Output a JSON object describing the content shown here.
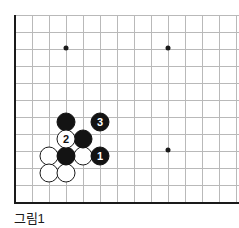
{
  "figure": {
    "caption": "그림1",
    "kind": "go-board-diagram"
  },
  "board": {
    "origin_x": 15,
    "origin_y": 15,
    "cell": 17,
    "cols": 14,
    "rows": 11,
    "edge_color": "#1a1a1a",
    "grid_color": "#b9b9b9",
    "background": "#ffffff"
  },
  "star_points": [
    {
      "name": "star-point-top-left",
      "x": 66,
      "y": 48
    },
    {
      "name": "star-point-top-right",
      "x": 168,
      "y": 48
    },
    {
      "name": "star-point-bottom-right",
      "x": 168,
      "y": 150
    }
  ],
  "stones": [
    {
      "id": "white-a",
      "color": "white",
      "x": 49,
      "y": 156,
      "label": ""
    },
    {
      "id": "white-b",
      "color": "white",
      "x": 83,
      "y": 156,
      "label": ""
    },
    {
      "id": "white-c",
      "color": "white",
      "x": 49,
      "y": 173,
      "label": ""
    },
    {
      "id": "white-d",
      "color": "white",
      "x": 66,
      "y": 173,
      "label": ""
    },
    {
      "id": "black-a",
      "color": "black",
      "x": 66,
      "y": 122,
      "label": ""
    },
    {
      "id": "black-b",
      "color": "black",
      "x": 83,
      "y": 139,
      "label": ""
    },
    {
      "id": "black-c",
      "color": "black",
      "x": 66,
      "y": 156,
      "label": ""
    },
    {
      "id": "move-2",
      "color": "white",
      "x": 66,
      "y": 139,
      "label": "2"
    },
    {
      "id": "move-3",
      "color": "black",
      "x": 100,
      "y": 122,
      "label": "3"
    },
    {
      "id": "move-1",
      "color": "black",
      "x": 100,
      "y": 156,
      "label": "1"
    }
  ]
}
